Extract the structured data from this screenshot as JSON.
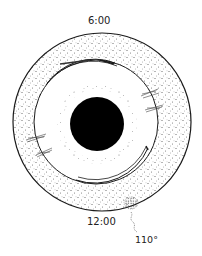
{
  "diagram": {
    "type": "eye-fundus-clock-diagram",
    "labels": {
      "top_clock": "6:00",
      "bottom_clock": "12:00",
      "angle": "110°"
    },
    "colors": {
      "line": "#1a1a1a",
      "stipple": "#555555",
      "pupil": "#000000",
      "background": "#ffffff"
    },
    "geometry": {
      "outer_circle": {
        "cx": 102,
        "cy": 122,
        "r": 89
      },
      "inner_circle": {
        "cx": 96,
        "cy": 122,
        "r": 62
      },
      "pupil": {
        "cx": 97,
        "cy": 124,
        "r": 27
      }
    },
    "markings": [
      {
        "name": "double-arc-top",
        "description": "double line arc near 6:00 on inner circle"
      },
      {
        "name": "double-arc-bottom-right",
        "description": "double line arc between 1:00 and 3:00 on inner circle"
      },
      {
        "name": "tear-marks-right",
        "description": "two hatched marks crossing inner circle on right"
      },
      {
        "name": "tear-marks-left",
        "description": "two hatched marks crossing inner circle on left"
      },
      {
        "name": "lesion-bottom",
        "description": "dense stippled spot near outer circle at 12:00-1:00"
      }
    ]
  }
}
